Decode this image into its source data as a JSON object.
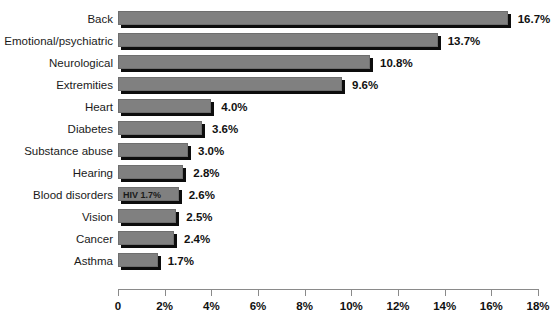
{
  "chart_data": {
    "type": "bar",
    "orientation": "horizontal",
    "title": "",
    "subtitle": "",
    "xlabel": "",
    "ylabel": "",
    "xlim": [
      0,
      18
    ],
    "xtick_labels": [
      "0",
      "2%",
      "4%",
      "6%",
      "8%",
      "10%",
      "12%",
      "14%",
      "16%",
      "18%"
    ],
    "xtick_values": [
      0,
      2,
      4,
      6,
      8,
      10,
      12,
      14,
      16,
      18
    ],
    "grid": false,
    "legend": null,
    "categories": [
      "Back",
      "Emotional/psychiatric",
      "Neurological",
      "Extremities",
      "Heart",
      "Diabetes",
      "Substance abuse",
      "Hearing",
      "Blood disorders",
      "Vision",
      "Cancer",
      "Asthma"
    ],
    "values": [
      16.7,
      13.7,
      10.8,
      9.6,
      4.0,
      3.6,
      3.0,
      2.8,
      2.6,
      2.5,
      2.4,
      1.7
    ],
    "value_labels": [
      "16.7%",
      "13.7%",
      "10.8%",
      "9.6%",
      "4.0%",
      "3.6%",
      "3.0%",
      "2.8%",
      "2.6%",
      "2.5%",
      "2.4%",
      "1.7%"
    ],
    "annotations": [
      {
        "category": "Blood disorders",
        "text": "HIV 1.7%",
        "value": 1.7,
        "position": "inside-bar-left"
      }
    ],
    "colors": {
      "bar_fill": "#808080",
      "bar_border": "#6e6e6e",
      "bar_shadow": "#0d0d0d",
      "axis": "#8a8a8a",
      "text": "#111111",
      "background": "#ffffff"
    }
  }
}
